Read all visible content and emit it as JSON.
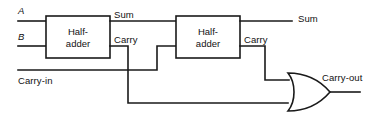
{
  "diagram": {
    "type": "logic-circuit",
    "colors": {
      "wire": "#1a1a1a",
      "background": "#ffffff",
      "text": "#111111"
    },
    "inputs": [
      {
        "id": "input-a",
        "label": "A",
        "italic": true
      },
      {
        "id": "input-b",
        "label": "B",
        "italic": true
      },
      {
        "id": "input-carry-in",
        "label": "Carry-in",
        "italic": false
      }
    ],
    "blocks": [
      {
        "id": "half-adder-1",
        "line1": "Half-",
        "line2": "adder",
        "out_sum": "Sum",
        "out_carry": "Carry"
      },
      {
        "id": "half-adder-2",
        "line1": "Half-",
        "line2": "adder",
        "out_sum": "Sum",
        "out_carry": "Carry"
      }
    ],
    "gates": [
      {
        "id": "or-gate-1",
        "kind": "OR"
      }
    ],
    "outputs": [
      {
        "id": "output-sum",
        "label": "Sum"
      },
      {
        "id": "output-carry-out",
        "label": "Carry-out"
      }
    ]
  }
}
